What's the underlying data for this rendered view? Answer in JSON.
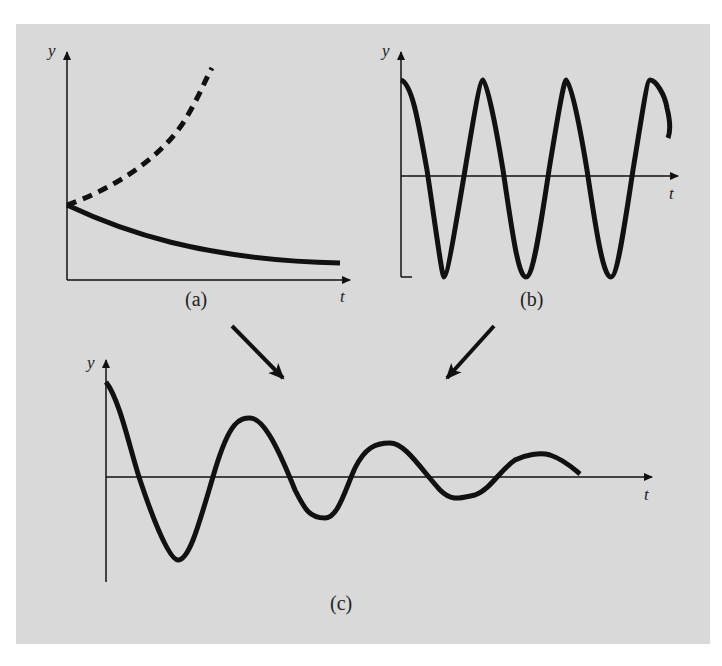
{
  "figure": {
    "background": "#d9d9d9",
    "line_color": "#111111",
    "panels": [
      {
        "id": "a",
        "caption": "(a)",
        "y_label": "y",
        "t_label": "t",
        "description": "Exponential growth (dashed) and exponential decay (solid) from common starting value"
      },
      {
        "id": "b",
        "caption": "(b)",
        "y_label": "y",
        "t_label": "t",
        "description": "Undamped sinusoidal oscillation"
      },
      {
        "id": "c",
        "caption": "(c)",
        "y_label": "y",
        "t_label": "t",
        "description": "Damped oscillation combining (a) decay and (b) oscillation"
      }
    ],
    "arrows": [
      {
        "from": "a",
        "to": "c"
      },
      {
        "from": "b",
        "to": "c"
      }
    ]
  }
}
